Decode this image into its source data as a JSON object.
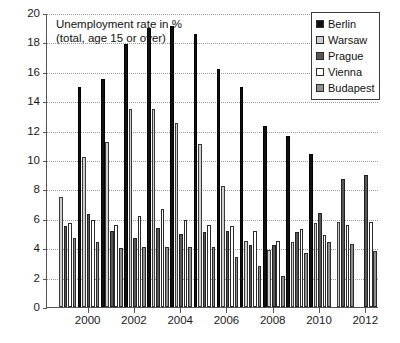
{
  "chart_data": {
    "type": "bar",
    "title": "Unemployment rate in %\n(total, age 15 or over)",
    "title_line1": "Unemployment rate in %",
    "title_line2": "(total, age 15 or over)",
    "xlabel": "",
    "ylabel": "",
    "ylim": [
      0,
      20
    ],
    "y_ticks": [
      0,
      2,
      4,
      6,
      8,
      10,
      12,
      14,
      16,
      18,
      20
    ],
    "grid": true,
    "legend_position": "top-right",
    "categories": [
      "1999",
      "2000",
      "2001",
      "2002",
      "2003",
      "2004",
      "2005",
      "2006",
      "2007",
      "2008",
      "2009",
      "2010",
      "2011",
      "2012"
    ],
    "x_tick_labels": [
      "2000",
      "2002",
      "2004",
      "2006",
      "2008",
      "2010",
      "2012"
    ],
    "series": [
      {
        "name": "Berlin",
        "color": "#111111",
        "values": [
          null,
          15.0,
          15.5,
          17.9,
          19.0,
          19.1,
          18.6,
          16.2,
          15.0,
          12.3,
          11.6,
          10.4,
          null,
          null
        ]
      },
      {
        "name": "Warsaw",
        "color": "#cfcfcf",
        "values": [
          7.5,
          10.2,
          11.2,
          13.5,
          13.5,
          12.5,
          11.1,
          8.2,
          4.5,
          3.9,
          4.4,
          5.7,
          5.8,
          null
        ]
      },
      {
        "name": "Prague",
        "color": "#575757",
        "values": [
          5.5,
          6.3,
          5.2,
          4.7,
          5.4,
          5.0,
          5.1,
          5.2,
          4.2,
          4.2,
          5.1,
          6.4,
          8.7,
          9.0
        ]
      },
      {
        "name": "Vienna",
        "color": "#ffffff",
        "values": [
          5.7,
          5.9,
          5.6,
          6.2,
          6.7,
          5.9,
          5.6,
          5.5,
          5.2,
          4.5,
          5.3,
          4.9,
          5.6,
          5.8
        ]
      },
      {
        "name": "Budapest",
        "color": "#8e8e8e",
        "values": [
          4.7,
          4.4,
          4.0,
          4.1,
          4.1,
          4.1,
          4.1,
          3.4,
          2.8,
          2.1,
          3.7,
          4.4,
          4.3,
          3.8
        ]
      }
    ]
  },
  "legend": {
    "items": [
      {
        "label": "Berlin"
      },
      {
        "label": "Warsaw"
      },
      {
        "label": "Prague"
      },
      {
        "label": "Vienna"
      },
      {
        "label": "Budapest"
      }
    ]
  }
}
